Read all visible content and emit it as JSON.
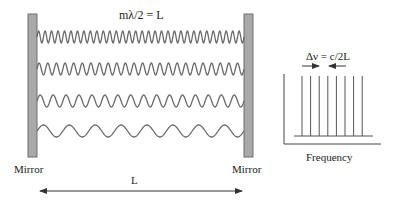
{
  "cavity": {
    "resonance_condition": "mλ/2 = L",
    "left_mirror_label": "Mirror",
    "right_mirror_label": "Mirror",
    "length_label": "L",
    "modes": [
      {
        "cycles": 32,
        "center_y": 37
      },
      {
        "cycles": 24,
        "center_y": 69
      },
      {
        "cycles": 16,
        "center_y": 101
      },
      {
        "cycles": 8,
        "center_y": 131
      }
    ],
    "colors": {
      "mirror_fill": "#a9a9a9",
      "mirror_stroke": "#6f6f6f",
      "wave": "#6a6a6a"
    }
  },
  "spectrum": {
    "spacing_label": "Δν = c/2L",
    "x_axis_label": "Frequency",
    "line_count": 8
  }
}
